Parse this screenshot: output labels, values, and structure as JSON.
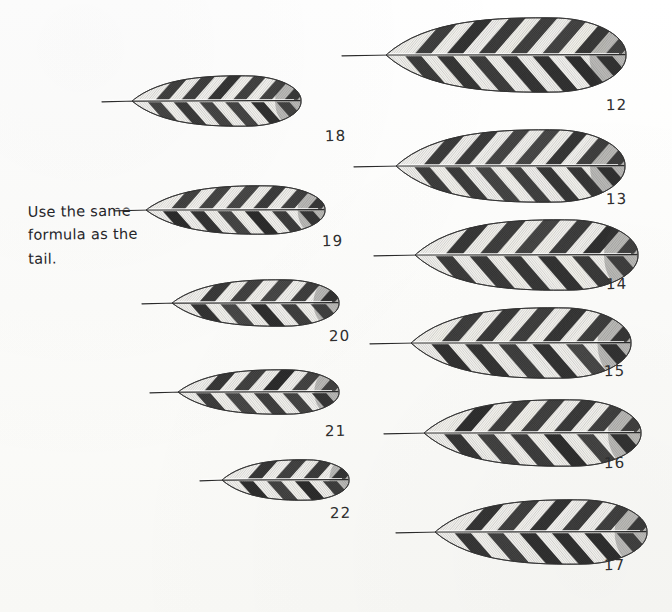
{
  "plate": {
    "title": "Feather study plate",
    "medium": "pencil drawing",
    "background_color": "#fdfdfb",
    "ink_color": "#2e2e2e",
    "note": {
      "text": "Use the same\nformula as the\ntail.",
      "line1": "Use the same",
      "line2": "formula as the",
      "line3": "tail."
    },
    "columns": [
      {
        "name": "left-column",
        "feathers": [
          {
            "label": "18",
            "length_px": 200,
            "width_px": 52,
            "bars": 6,
            "x": 100,
            "y": 68,
            "label_x": 325,
            "label_y": 127
          },
          {
            "label": "19",
            "length_px": 212,
            "width_px": 50,
            "bars": 6,
            "x": 112,
            "y": 178,
            "label_x": 322,
            "label_y": 232
          },
          {
            "label": "20",
            "length_px": 198,
            "width_px": 48,
            "bars": 5,
            "x": 140,
            "y": 272,
            "label_x": 329,
            "label_y": 327
          },
          {
            "label": "21",
            "length_px": 190,
            "width_px": 46,
            "bars": 5,
            "x": 148,
            "y": 362,
            "label_x": 325,
            "label_y": 422
          },
          {
            "label": "22",
            "length_px": 150,
            "width_px": 42,
            "bars": 4,
            "x": 198,
            "y": 452,
            "label_x": 330,
            "label_y": 504
          }
        ]
      },
      {
        "name": "right-column",
        "feathers": [
          {
            "label": "12",
            "length_px": 285,
            "width_px": 76,
            "bars": 7,
            "x": 340,
            "y": 10,
            "label_x": 606,
            "label_y": 96
          },
          {
            "label": "13",
            "length_px": 272,
            "width_px": 74,
            "bars": 7,
            "x": 352,
            "y": 122,
            "label_x": 606,
            "label_y": 190
          },
          {
            "label": "14",
            "length_px": 265,
            "width_px": 72,
            "bars": 6,
            "x": 372,
            "y": 212,
            "label_x": 606,
            "label_y": 275
          },
          {
            "label": "15",
            "length_px": 262,
            "width_px": 72,
            "bars": 6,
            "x": 368,
            "y": 300,
            "label_x": 604,
            "label_y": 362
          },
          {
            "label": "16",
            "length_px": 258,
            "width_px": 68,
            "bars": 6,
            "x": 382,
            "y": 392,
            "label_x": 604,
            "label_y": 454
          },
          {
            "label": "17",
            "length_px": 252,
            "width_px": 66,
            "bars": 6,
            "x": 394,
            "y": 492,
            "label_x": 604,
            "label_y": 556
          }
        ]
      }
    ]
  }
}
